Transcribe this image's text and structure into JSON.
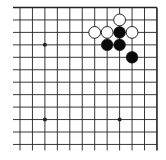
{
  "diagram": {
    "type": "go-board-corner",
    "grid": {
      "columns": 12,
      "rows": 12,
      "origin_x": 20,
      "origin_y": 7.5,
      "spacing": 12.45,
      "open_left": true,
      "open_bottom": true,
      "top_edge": true,
      "right_edge": true,
      "line_color": "#222222"
    },
    "star_points": [
      {
        "col": 2,
        "row": 3
      },
      {
        "col": 2,
        "row": 9
      },
      {
        "col": 8,
        "row": 9
      }
    ],
    "stones": [
      {
        "color": "white",
        "col": 8,
        "row": 1
      },
      {
        "color": "white",
        "col": 6,
        "row": 2
      },
      {
        "color": "white",
        "col": 7,
        "row": 2
      },
      {
        "color": "black",
        "col": 8,
        "row": 2
      },
      {
        "color": "white",
        "col": 9,
        "row": 2
      },
      {
        "color": "black",
        "col": 7,
        "row": 3
      },
      {
        "color": "black",
        "col": 8,
        "row": 3
      },
      {
        "color": "black",
        "col": 9,
        "row": 4
      }
    ],
    "colors": {
      "black_stone": "#0a0a0a",
      "white_stone": "#ffffff",
      "stone_outline": "#111111",
      "background": "#ffffff"
    }
  }
}
